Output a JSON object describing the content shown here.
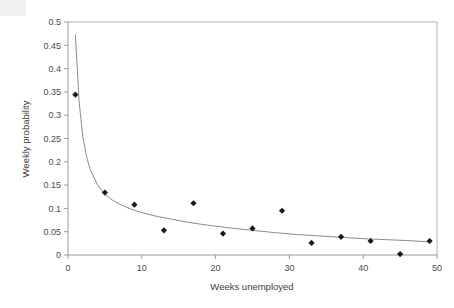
{
  "figure": {
    "artifact_label": "scan-edge-artifact",
    "cropped_header_text": "",
    "background_color": "#ffffff"
  },
  "chart_data": {
    "type": "scatter",
    "title": "",
    "subtitle": "",
    "xlabel": "Weeks unemployed",
    "ylabel": "Weekly probability",
    "xlim": [
      0,
      50
    ],
    "ylim": [
      0,
      0.5
    ],
    "xticks": [
      0,
      10,
      20,
      30,
      40,
      50
    ],
    "xtick_labels": [
      "0",
      "10",
      "20",
      "30",
      "40",
      "50"
    ],
    "yticks": [
      0,
      0.05,
      0.1,
      0.15,
      0.2,
      0.25,
      0.3,
      0.35,
      0.4,
      0.45,
      0.5
    ],
    "ytick_labels": [
      "0",
      "0.05",
      "0.1",
      "0.15",
      "0.2",
      "0.25",
      "0.3",
      "0.35",
      "0.4",
      "0.45",
      "0.5"
    ],
    "grid": false,
    "legend": false,
    "legend_position": "none",
    "marker_style": "diamond",
    "marker_color": "#1a1a1a",
    "line_color": "#8c8c8c",
    "axis_color": "#9a9a9a",
    "series": [
      {
        "name": "Observed weekly probability",
        "type": "scatter",
        "x": [
          1,
          5,
          9,
          13,
          17,
          21,
          25,
          29,
          33,
          37,
          41,
          45,
          49
        ],
        "values": [
          0.344,
          0.134,
          0.108,
          0.053,
          0.111,
          0.046,
          0.057,
          0.095,
          0.026,
          0.039,
          0.03,
          0.002,
          0.03
        ]
      },
      {
        "name": "Fitted hazard curve",
        "type": "line",
        "x": [
          1,
          1.5,
          2,
          2.5,
          3,
          4,
          5,
          6,
          7,
          8,
          9,
          10,
          12,
          14,
          16,
          18,
          20,
          22,
          25,
          28,
          31,
          34,
          37,
          40,
          43,
          46,
          49
        ],
        "values": [
          0.473,
          0.33,
          0.255,
          0.212,
          0.184,
          0.15,
          0.13,
          0.118,
          0.109,
          0.102,
          0.096,
          0.091,
          0.083,
          0.077,
          0.071,
          0.066,
          0.062,
          0.058,
          0.053,
          0.048,
          0.044,
          0.041,
          0.038,
          0.035,
          0.033,
          0.031,
          0.028
        ]
      }
    ]
  }
}
